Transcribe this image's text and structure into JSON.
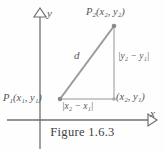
{
  "figure": {
    "caption": "Figure 1.6.3",
    "axes": {
      "x_label": "x",
      "y_label": "y"
    },
    "points": {
      "p1_label_main": "P",
      "p1_label_sub": "1",
      "p1_label_coords": "(x₁, y₁)",
      "p2_label_main": "P",
      "p2_label_sub": "2",
      "p2_label_coords": "(x₂, y₂)",
      "corner_label": "(x₂, y₁)"
    },
    "segments": {
      "hypotenuse_label": "d",
      "vertical_leg_label": "|y₂ − y₁|",
      "horizontal_leg_label": "|x₂ − x₁|"
    },
    "colors": {
      "line": "#8c8c8c",
      "axis": "#6f6f6f",
      "text": "#555555",
      "background": "#fefefe"
    }
  }
}
